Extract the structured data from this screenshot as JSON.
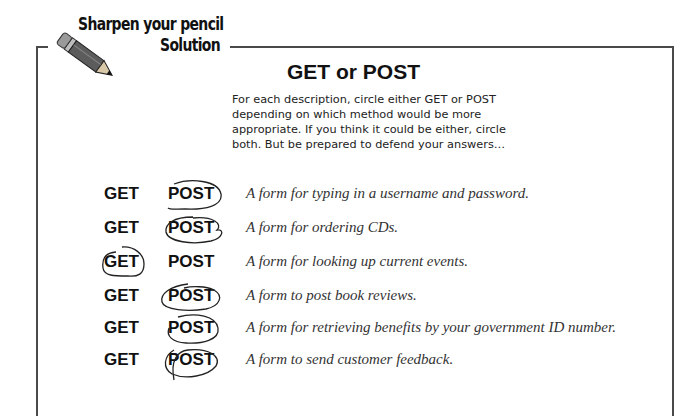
{
  "header": {
    "banner_line1": "Sharpen your pencil",
    "banner_line2": "Solution",
    "icon": "pencil-icon"
  },
  "exercise": {
    "title": "GET or POST",
    "instructions": "For each description, circle either GET or POST depending on which method would be more appropriate. If you think it could be either, circle both. But be prepared to defend your answers…",
    "rows": [
      {
        "get_label": "GET",
        "post_label": "POST",
        "circled": "POST",
        "description": "A form for typing in a username and password."
      },
      {
        "get_label": "GET",
        "post_label": "POST",
        "circled": "POST",
        "description": "A form for ordering CDs."
      },
      {
        "get_label": "GET",
        "post_label": "POST",
        "circled": "GET",
        "description": "A form for looking up current events."
      },
      {
        "get_label": "GET",
        "post_label": "POST",
        "circled": "POST",
        "description": "A form to post book reviews."
      },
      {
        "get_label": "GET",
        "post_label": "POST",
        "circled": "POST",
        "description": "A form for retrieving benefits by your government ID number."
      },
      {
        "get_label": "GET",
        "post_label": "POST",
        "circled": "POST",
        "description": "A form to send customer feedback."
      }
    ]
  },
  "colors": {
    "frame": "#4a4a4a",
    "text": "#111111",
    "description": "#333333"
  }
}
